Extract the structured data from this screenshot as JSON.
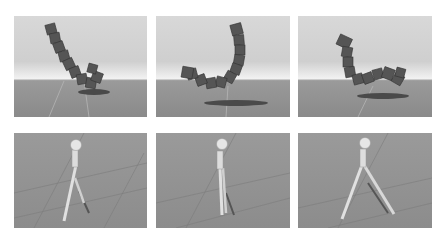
{
  "figure": {
    "rows": [
      {
        "name": "snake-chain",
        "panels": [
          {
            "id": "top-left",
            "subject": "chain of cubes bending up",
            "bg": "sky"
          },
          {
            "id": "top-middle",
            "subject": "chain of cubes U-shape",
            "bg": "sky"
          },
          {
            "id": "top-right",
            "subject": "chain of cubes curved",
            "bg": "sky"
          }
        ]
      },
      {
        "name": "biped-walker",
        "panels": [
          {
            "id": "bottom-left",
            "subject": "stick biped walking",
            "bg": "floor"
          },
          {
            "id": "bottom-middle",
            "subject": "stick biped standing",
            "bg": "floor"
          },
          {
            "id": "bottom-right",
            "subject": "stick biped wide stance",
            "bg": "floor"
          }
        ]
      }
    ],
    "colors": {
      "background": "#ffffff",
      "cube": "#555555",
      "cube_dark": "#3a3a3a",
      "shadow": "#4a4a4a",
      "leg": "#dedede",
      "head": "#e6e6e6",
      "grid": "#b0b0b0"
    }
  }
}
